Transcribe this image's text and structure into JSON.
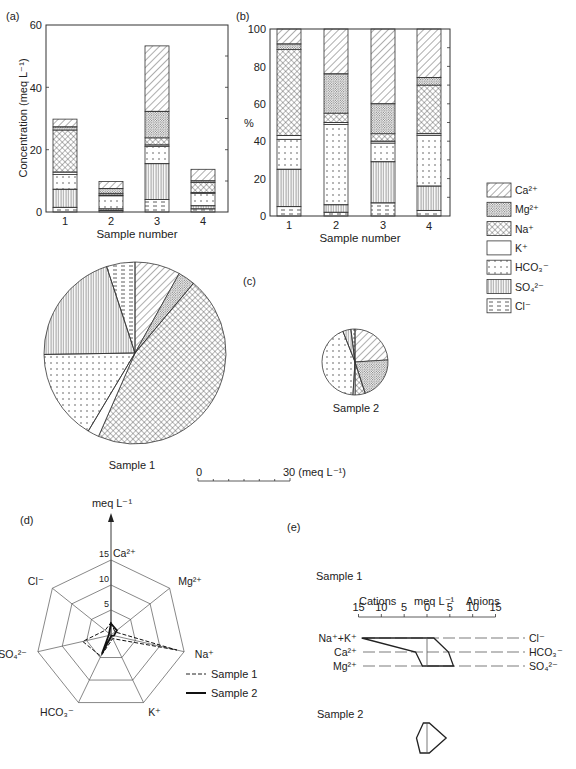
{
  "panels": {
    "a": {
      "label": "(a)",
      "ylabel": "Concentration (meq L⁻¹)",
      "xlabel": "Sample number"
    },
    "b": {
      "label": "(b)",
      "ylabel": "%",
      "xlabel": "Sample number"
    },
    "c": {
      "label": "(c)",
      "sample1_label": "Sample 1",
      "sample2_label": "Sample 2",
      "scale_start": "0",
      "scale_end": "30 (meq L⁻¹)"
    },
    "d": {
      "label": "(d)",
      "axis_title": "meq L⁻¹",
      "legend_sample1": "Sample 1",
      "legend_sample2": "Sample 2"
    },
    "e": {
      "label": "(e)",
      "sample1_label": "Sample 1",
      "sample2_label": "Sample 2",
      "cations": "Cations",
      "units": "meq L⁻¹",
      "anions": "Anions"
    }
  },
  "legend": [
    {
      "name": "Ca²⁺",
      "pattern": "diag"
    },
    {
      "name": "Mg²⁺",
      "pattern": "stipple"
    },
    {
      "name": "Na⁺",
      "pattern": "cross"
    },
    {
      "name": "K⁺",
      "pattern": "blank"
    },
    {
      "name": "HCO₃⁻",
      "pattern": "dots"
    },
    {
      "name": "SO₄²⁻",
      "pattern": "vert"
    },
    {
      "name": "Cl⁻",
      "pattern": "dash"
    }
  ],
  "chart_data": [
    {
      "type": "bar",
      "title": "(a)",
      "stacked": true,
      "categories": [
        "1",
        "2",
        "3",
        "4"
      ],
      "xlabel": "Sample number",
      "ylabel": "Concentration (meq L⁻¹)",
      "ylim": [
        0,
        60
      ],
      "yticks": [
        0,
        20,
        40,
        60
      ],
      "series_order_bottom_to_top": [
        "Cl⁻",
        "SO₄²⁻",
        "HCO₃⁻",
        "K⁺",
        "Na⁺",
        "Mg²⁺",
        "Ca²⁺"
      ],
      "series": [
        {
          "name": "Cl⁻",
          "values": [
            1.5,
            0.5,
            4.0,
            1.0
          ]
        },
        {
          "name": "SO₄²⁻",
          "values": [
            5.8,
            0.5,
            11.5,
            1.0
          ]
        },
        {
          "name": "HCO₃⁻",
          "values": [
            4.7,
            4.2,
            5.5,
            4.0
          ]
        },
        {
          "name": "K⁺",
          "values": [
            0.8,
            0.2,
            0.5,
            0.2
          ]
        },
        {
          "name": "Na⁺",
          "values": [
            13.5,
            0.6,
            2.3,
            3.3
          ]
        },
        {
          "name": "Mg²⁺",
          "values": [
            1.0,
            1.5,
            8.5,
            0.5
          ]
        },
        {
          "name": "Ca²⁺",
          "values": [
            2.5,
            2.3,
            21.0,
            3.7
          ]
        }
      ],
      "totals": [
        30,
        9.8,
        53,
        13.7
      ]
    },
    {
      "type": "bar",
      "title": "(b)",
      "stacked": true,
      "categories": [
        "1",
        "2",
        "3",
        "4"
      ],
      "xlabel": "Sample number",
      "ylabel": "%",
      "ylim": [
        0,
        100
      ],
      "yticks": [
        0,
        20,
        40,
        60,
        80,
        100
      ],
      "series": [
        {
          "name": "Cl⁻",
          "values": [
            5,
            2,
            7,
            3
          ]
        },
        {
          "name": "SO₄²⁻",
          "values": [
            20,
            4,
            22,
            13
          ]
        },
        {
          "name": "HCO₃⁻",
          "values": [
            16,
            43,
            10,
            27
          ]
        },
        {
          "name": "K⁺",
          "values": [
            2,
            1,
            1,
            1
          ]
        },
        {
          "name": "Na⁺",
          "values": [
            46,
            5,
            4,
            26
          ]
        },
        {
          "name": "Mg²⁺",
          "values": [
            3,
            21,
            16,
            4
          ]
        },
        {
          "name": "Ca²⁺",
          "values": [
            8,
            24,
            40,
            26
          ]
        }
      ]
    },
    {
      "type": "pie",
      "title": "(c) Sample 1",
      "labels": [
        "Ca²⁺",
        "Mg²⁺",
        "Na⁺",
        "K⁺",
        "HCO₃⁻",
        "SO₄²⁻",
        "Cl⁻"
      ],
      "values_percent": [
        8,
        3,
        45,
        2,
        16,
        20,
        5
      ],
      "total_meq": 30
    },
    {
      "type": "pie",
      "title": "(c) Sample 2",
      "labels": [
        "Ca²⁺",
        "Mg²⁺",
        "Na⁺",
        "K⁺",
        "HCO₃⁻",
        "SO₄²⁻",
        "Cl⁻"
      ],
      "values_percent": [
        24,
        21,
        5,
        1,
        43,
        4,
        2
      ],
      "total_meq": 9.8,
      "scale_bar": {
        "min": 0,
        "max": 30,
        "unit": "meq L⁻¹"
      }
    },
    {
      "type": "radar",
      "title": "(d)",
      "axis_title": "meq L⁻¹",
      "axes": [
        "Ca²⁺",
        "Mg²⁺",
        "Na⁺",
        "K⁺",
        "HCO₃⁻",
        "SO₄²⁻",
        "Cl⁻"
      ],
      "rings": [
        5,
        10,
        15
      ],
      "series": [
        {
          "name": "Sample 1",
          "style": "dashed",
          "values": [
            2.5,
            1.0,
            13.5,
            0.8,
            4.7,
            5.8,
            1.5
          ]
        },
        {
          "name": "Sample 2",
          "style": "solid",
          "values": [
            2.3,
            1.5,
            0.6,
            0.2,
            4.2,
            0.5,
            0.5
          ]
        }
      ]
    },
    {
      "type": "line",
      "subtype": "stiff-diagram",
      "title": "(e)",
      "x_ticks": [
        15,
        10,
        5,
        0,
        5,
        10,
        15
      ],
      "x_labels": {
        "left": "Cations",
        "center": "meq L⁻¹",
        "right": "Anions"
      },
      "rows": [
        {
          "cation": "Na⁺+K⁺",
          "anion": "Cl⁻"
        },
        {
          "cation": "Ca²⁺",
          "anion": "HCO₃⁻"
        },
        {
          "cation": "Mg²⁺",
          "anion": "SO₄²⁻"
        }
      ],
      "samples": [
        {
          "name": "Sample 1",
          "cations": [
            14.3,
            2.5,
            1.0
          ],
          "anions": [
            1.5,
            4.7,
            5.8
          ]
        },
        {
          "name": "Sample 2",
          "cations": [
            0.8,
            2.3,
            1.5
          ],
          "anions": [
            0.5,
            4.2,
            0.5
          ]
        }
      ]
    }
  ]
}
